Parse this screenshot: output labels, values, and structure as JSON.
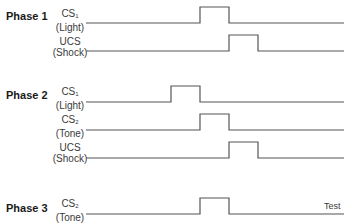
{
  "diagram": {
    "type": "timing-diagram",
    "stroke_color": "#555555",
    "phases": [
      {
        "label": "Phase 1",
        "rows": [
          {
            "stimulus": "CS",
            "subscript": "1",
            "desc": "(Light)",
            "pulse_start": 200,
            "pulse_end": 229
          },
          {
            "stimulus": "UCS",
            "subscript": "",
            "desc": "(Shock)",
            "pulse_start": 229,
            "pulse_end": 258
          }
        ]
      },
      {
        "label": "Phase 2",
        "rows": [
          {
            "stimulus": "CS",
            "subscript": "1",
            "desc": "(Light)",
            "pulse_start": 171,
            "pulse_end": 200
          },
          {
            "stimulus": "CS",
            "subscript": "2",
            "desc": "(Tone)",
            "pulse_start": 200,
            "pulse_end": 229
          },
          {
            "stimulus": "UCS",
            "subscript": "",
            "desc": "(Shock)",
            "pulse_start": 229,
            "pulse_end": 258
          }
        ]
      },
      {
        "label": "Phase 3",
        "rows": [
          {
            "stimulus": "CS",
            "subscript": "2",
            "desc": "(Tone)",
            "pulse_start": 200,
            "pulse_end": 229
          }
        ],
        "annotation": "Test"
      }
    ]
  }
}
